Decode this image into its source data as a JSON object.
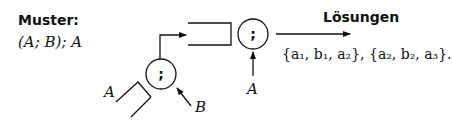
{
  "pattern": {
    "label": "Muster:",
    "expression": "(A; B); A"
  },
  "diagram": {
    "nodes": [
      {
        "id": "inner-seq",
        "symbol": ";"
      },
      {
        "id": "outer-seq",
        "symbol": ";"
      }
    ],
    "inputs": {
      "inner_left": "A",
      "inner_right": "B",
      "outer_right": "A"
    }
  },
  "solutions": {
    "label": "Lösungen",
    "text": "{a₁, b₁, a₂}, {a₂, b₂, a₃}."
  }
}
